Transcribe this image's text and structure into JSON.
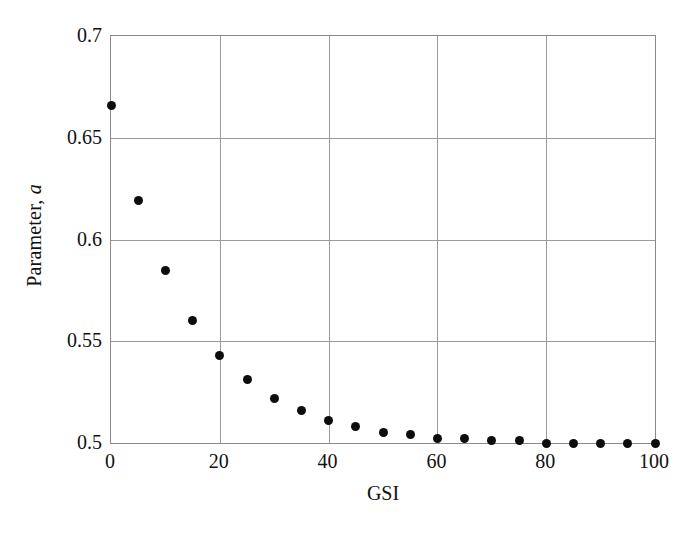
{
  "chart_data": {
    "type": "scatter",
    "title": "",
    "xlabel": "GSI",
    "ylabel_prefix": "Parameter, ",
    "ylabel_italic": "a",
    "xlim": [
      0,
      100
    ],
    "ylim": [
      0.5,
      0.7
    ],
    "grid": true,
    "legend": null,
    "xticks": [
      0,
      20,
      40,
      60,
      80,
      100
    ],
    "xtick_labels": [
      "0",
      "20",
      "40",
      "60",
      "80",
      "100"
    ],
    "yticks": [
      0.5,
      0.55,
      0.6,
      0.65,
      0.7
    ],
    "ytick_labels": [
      "0.5",
      "0.55",
      "0.6",
      "0.65",
      "0.7"
    ],
    "marker": "filled-circle",
    "marker_color": "#0d0d0d",
    "x": [
      0,
      5,
      10,
      15,
      20,
      25,
      30,
      35,
      40,
      45,
      50,
      55,
      60,
      65,
      70,
      75,
      80,
      85,
      90,
      95,
      100
    ],
    "y": [
      0.666,
      0.619,
      0.585,
      0.56,
      0.543,
      0.531,
      0.522,
      0.516,
      0.511,
      0.508,
      0.505,
      0.504,
      0.502,
      0.502,
      0.501,
      0.501,
      0.5,
      0.5,
      0.5,
      0.5,
      0.5
    ],
    "series": [
      {
        "name": "Parameter a",
        "points": [
          {
            "x": 0,
            "y": 0.666
          },
          {
            "x": 5,
            "y": 0.619
          },
          {
            "x": 10,
            "y": 0.585
          },
          {
            "x": 15,
            "y": 0.56
          },
          {
            "x": 20,
            "y": 0.543
          },
          {
            "x": 25,
            "y": 0.531
          },
          {
            "x": 30,
            "y": 0.522
          },
          {
            "x": 35,
            "y": 0.516
          },
          {
            "x": 40,
            "y": 0.511
          },
          {
            "x": 45,
            "y": 0.508
          },
          {
            "x": 50,
            "y": 0.505
          },
          {
            "x": 55,
            "y": 0.504
          },
          {
            "x": 60,
            "y": 0.502
          },
          {
            "x": 65,
            "y": 0.502
          },
          {
            "x": 70,
            "y": 0.501
          },
          {
            "x": 75,
            "y": 0.501
          },
          {
            "x": 80,
            "y": 0.5
          },
          {
            "x": 85,
            "y": 0.5
          },
          {
            "x": 90,
            "y": 0.5
          },
          {
            "x": 95,
            "y": 0.5
          },
          {
            "x": 100,
            "y": 0.5
          }
        ]
      }
    ],
    "gridlines_x": [
      20,
      40,
      60,
      80
    ],
    "gridlines_y": [
      0.55,
      0.6,
      0.65
    ],
    "colors": {
      "frame": "#8a8a8a",
      "grid": "#9a9a9a",
      "marker": "#0d0d0d",
      "text": "#111111",
      "background": "#ffffff"
    }
  }
}
